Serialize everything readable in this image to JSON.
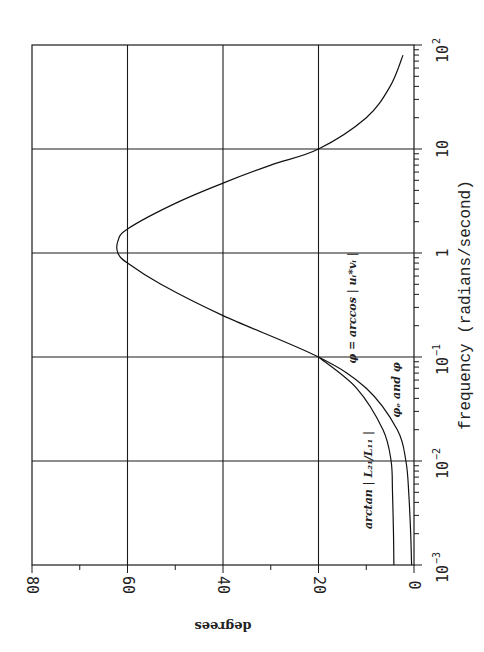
{
  "chart_data": {
    "type": "line",
    "orientation": "rotated-90-clockwise",
    "title": "",
    "xlabel": "frequency (radians/second)",
    "ylabel": "degrees",
    "xscale": "log",
    "xlim": [
      0.001,
      100
    ],
    "ylim": [
      0,
      80
    ],
    "grid": true,
    "x_tick_labels": [
      "10^-3",
      "10^-2",
      "10^-1",
      "1",
      "10",
      "10^2"
    ],
    "y_tick_labels": [
      "0",
      "20",
      "40",
      "60",
      "80"
    ],
    "series": [
      {
        "name": "phi = arccos | u_i^* v_i |",
        "x": [
          0.001,
          0.002,
          0.005,
          0.01,
          0.02,
          0.05,
          0.1,
          0.25,
          0.5,
          0.8,
          1.0,
          1.3,
          1.7,
          3,
          4.7,
          7,
          10,
          20,
          40,
          80
        ],
        "y": [
          0.5,
          0.7,
          1.1,
          1.7,
          3.5,
          10,
          20,
          40,
          53,
          60,
          62,
          62,
          60,
          50,
          40,
          30,
          20,
          10,
          5,
          2.3
        ]
      },
      {
        "name": "arctan | L_21 / L_11 |",
        "x": [
          0.001,
          0.002,
          0.005,
          0.01,
          0.02,
          0.05,
          0.1
        ],
        "y": [
          4.2,
          4.3,
          4.5,
          4.8,
          6.5,
          12,
          20
        ]
      }
    ],
    "annotations": [
      "phi = arccos | u_i^* v_i |",
      "phi_e and phi",
      "arctan | L_21 / L_11 |"
    ]
  },
  "labels": {
    "x_title": "frequency (radians/second)",
    "y_title": "degrees",
    "x_ticks": [
      {
        "base": "10",
        "exp": "-3"
      },
      {
        "base": "10",
        "exp": "-2"
      },
      {
        "base": "10",
        "exp": "-1"
      },
      {
        "base": "1",
        "exp": ""
      },
      {
        "base": "10",
        "exp": ""
      },
      {
        "base": "10",
        "exp": "2"
      }
    ],
    "y_ticks": [
      "0",
      "20",
      "40",
      "60",
      "80"
    ],
    "anno_phi": "φ = arccos | uᵢ*vᵢ |",
    "anno_phie": "φₑ  and φ",
    "anno_arctan": "arctan | L₂₁/L₁₁ |"
  }
}
